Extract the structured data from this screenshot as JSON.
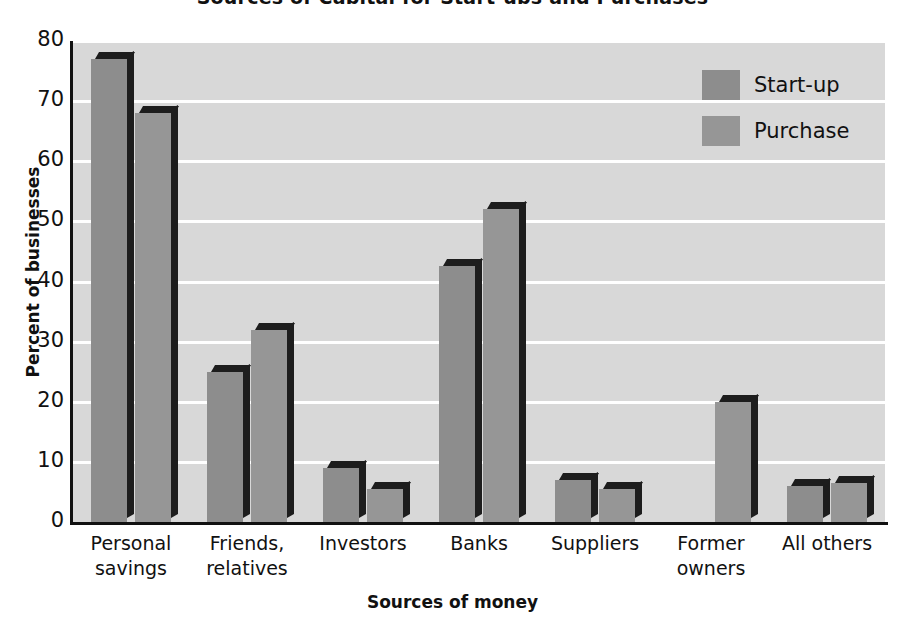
{
  "chart_data": {
    "type": "bar",
    "title": "Sources of Capital for Start-ups and Purchases",
    "xlabel": "Sources of money",
    "ylabel": "Percent of businesses",
    "ylim": [
      0,
      80
    ],
    "yticks": [
      0,
      10,
      20,
      30,
      40,
      50,
      60,
      70,
      80
    ],
    "grid": true,
    "legend_position": "top-right",
    "categories": [
      "Personal savings",
      "Friends, relatives",
      "Investors",
      "Banks",
      "Suppliers",
      "Former owners",
      "All others"
    ],
    "category_lines": [
      [
        "Personal",
        "savings"
      ],
      [
        "Friends,",
        "relatives"
      ],
      [
        "Investors",
        ""
      ],
      [
        "Banks",
        ""
      ],
      [
        "Suppliers",
        ""
      ],
      [
        "Former",
        "owners"
      ],
      [
        "All others",
        ""
      ]
    ],
    "series": [
      {
        "name": "Start-up",
        "color": "#8d8d8d",
        "values": [
          77,
          25,
          9,
          42.5,
          7,
          null,
          6
        ]
      },
      {
        "name": "Purchase",
        "color": "#969696",
        "values": [
          68,
          32,
          5.5,
          52,
          5.5,
          20,
          6.5
        ]
      }
    ]
  },
  "legend": {
    "items": [
      {
        "label": "Start-up",
        "swatch": "startup"
      },
      {
        "label": "Purchase",
        "swatch": "purchase"
      }
    ]
  }
}
